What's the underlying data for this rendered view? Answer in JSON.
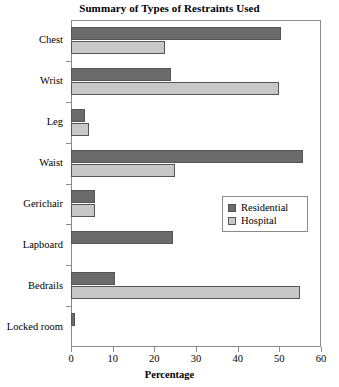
{
  "chart_data": {
    "type": "bar",
    "orientation": "horizontal",
    "title": "Summary of Types of Restraints Used",
    "xlabel": "Percentage",
    "ylabel": "",
    "xlim": [
      0,
      60
    ],
    "xticks": [
      0,
      10,
      20,
      30,
      40,
      50,
      60
    ],
    "grid": false,
    "legend_position": "center-right",
    "categories": [
      "Chest",
      "Wrist",
      "Leg",
      "Waist",
      "Gerichair",
      "Lapboard",
      "Bedrails",
      "Locked room"
    ],
    "series": [
      {
        "name": "Residential",
        "color": "#6b6b6b",
        "values": [
          50.4,
          24.0,
          3.4,
          55.6,
          5.8,
          24.5,
          10.5,
          1.0
        ]
      },
      {
        "name": "Hospital",
        "color": "#c8c8c8",
        "values": [
          22.5,
          50.0,
          4.3,
          25.0,
          5.8,
          0,
          54.9,
          0
        ]
      }
    ]
  },
  "legend": {
    "entries": [
      {
        "label": "Residential",
        "color": "#6b6b6b"
      },
      {
        "label": "Hospital",
        "color": "#c8c8c8"
      }
    ]
  },
  "axis": {
    "x_tick_labels": [
      "0",
      "10",
      "20",
      "30",
      "40",
      "50",
      "60"
    ],
    "x_title": "Percentage"
  },
  "colors": {
    "residential": "#6b6b6b",
    "hospital": "#c8c8c8",
    "frame": "#8a8a8a",
    "bar_border": "#555555",
    "background": "#ffffff",
    "text": "#000000"
  }
}
